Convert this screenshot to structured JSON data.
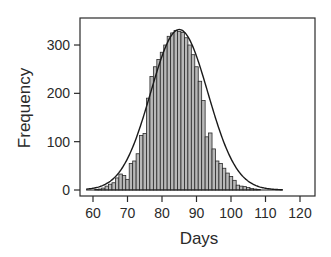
{
  "chart_data": {
    "type": "bar",
    "title": "",
    "xlabel": "Days",
    "ylabel": "Frequency",
    "xlim": [
      56,
      124
    ],
    "ylim": [
      -10,
      355
    ],
    "xticks": [
      60,
      70,
      80,
      90,
      100,
      110,
      120
    ],
    "yticks": [
      0,
      100,
      200,
      300
    ],
    "grid": false,
    "legend": null,
    "bin_width": 1,
    "x": [
      60,
      61,
      62,
      63,
      64,
      65,
      66,
      67,
      68,
      69,
      70,
      71,
      72,
      73,
      74,
      75,
      76,
      77,
      78,
      79,
      80,
      81,
      82,
      83,
      84,
      85,
      86,
      87,
      88,
      89,
      90,
      91,
      92,
      93,
      94,
      95,
      96,
      97,
      98,
      99,
      100,
      101,
      102,
      103,
      104,
      105,
      106,
      107,
      108
    ],
    "values": [
      0,
      1,
      2,
      4,
      8,
      12,
      15,
      25,
      33,
      30,
      22,
      55,
      60,
      75,
      113,
      117,
      190,
      235,
      255,
      270,
      285,
      300,
      318,
      325,
      330,
      328,
      326,
      315,
      300,
      280,
      255,
      225,
      185,
      110,
      118,
      85,
      60,
      55,
      45,
      35,
      28,
      20,
      10,
      8,
      7,
      5,
      3,
      2,
      1
    ],
    "overlay": {
      "type": "normal-curve",
      "mean": 85,
      "peak": 332,
      "sd": 8.3,
      "x_range": [
        58,
        115
      ]
    },
    "colors": {
      "bar_fill": "#b8b8b8",
      "bar_stroke": "#2a2a2a",
      "curve": "#1a1a1a",
      "frame": "#2a2a2a"
    }
  },
  "axes": {
    "x_title": "Days",
    "y_title": "Frequency",
    "x_tick_labels": [
      "60",
      "70",
      "80",
      "90",
      "100",
      "110",
      "120"
    ],
    "y_tick_labels": [
      "0",
      "100",
      "200",
      "300"
    ]
  }
}
